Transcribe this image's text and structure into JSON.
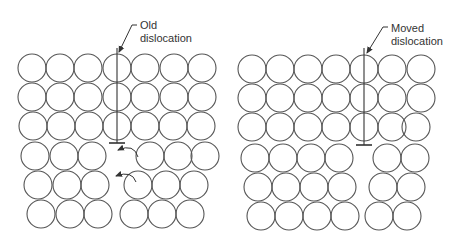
{
  "colors": {
    "stroke": "#555555",
    "line": "#333333",
    "background": "#ffffff"
  },
  "atom_radius": 14,
  "panels": [
    {
      "id": "old",
      "label_line1": "Old",
      "label_line2": "dislocation",
      "label_pos": {
        "x": 140,
        "y": 19
      },
      "leader": {
        "points": [
          [
            137,
            25
          ],
          [
            132,
            25
          ],
          [
            119,
            52
          ]
        ]
      },
      "dislocation_line": {
        "x": 117,
        "y1": 48,
        "y2": 143
      },
      "tbar": {
        "x1": 109,
        "x2": 125,
        "y": 143
      },
      "rows": [
        {
          "y": 68,
          "xs": [
            32,
            60,
            88,
            117,
            145,
            174,
            202
          ]
        },
        {
          "y": 97,
          "xs": [
            32,
            60,
            88,
            117,
            145,
            174,
            202
          ]
        },
        {
          "y": 126,
          "xs": [
            33,
            61,
            89,
            117,
            145,
            173,
            201
          ]
        },
        {
          "y": 156,
          "xs": [
            35,
            64,
            92,
            150,
            178,
            205
          ]
        },
        {
          "y": 185,
          "xs": [
            38,
            67,
            95,
            138,
            166,
            194
          ]
        },
        {
          "y": 214,
          "xs": [
            41,
            70,
            98,
            134,
            162,
            190
          ]
        }
      ],
      "arrows": [
        {
          "from": [
            138,
            157
          ],
          "ctrl": [
            134,
            143
          ],
          "to": [
            118,
            150
          ]
        },
        {
          "from": [
            136,
            182
          ],
          "ctrl": [
            132,
            170
          ],
          "to": [
            116,
            176
          ]
        }
      ]
    },
    {
      "id": "moved",
      "label_line1": "Moved",
      "label_line2": "dislocation",
      "label_pos": {
        "x": 391,
        "y": 22
      },
      "leader": {
        "points": [
          [
            388,
            27
          ],
          [
            383,
            27
          ],
          [
            367,
            53
          ]
        ]
      },
      "dislocation_line": {
        "x": 364,
        "y1": 48,
        "y2": 145
      },
      "tbar": {
        "x1": 356,
        "x2": 372,
        "y": 145
      },
      "rows": [
        {
          "y": 69,
          "xs": [
            252,
            280,
            308,
            336,
            364,
            392,
            421
          ]
        },
        {
          "y": 98,
          "xs": [
            252,
            280,
            308,
            336,
            364,
            392,
            421
          ]
        },
        {
          "y": 127,
          "xs": [
            252,
            280,
            308,
            336,
            364,
            392,
            416
          ]
        },
        {
          "y": 158,
          "xs": [
            255,
            283,
            311,
            339,
            387,
            415
          ]
        },
        {
          "y": 187,
          "xs": [
            258,
            286,
            314,
            342,
            383,
            411
          ]
        },
        {
          "y": 216,
          "xs": [
            261,
            289,
            317,
            345,
            379,
            407
          ]
        }
      ],
      "arrows": []
    }
  ]
}
